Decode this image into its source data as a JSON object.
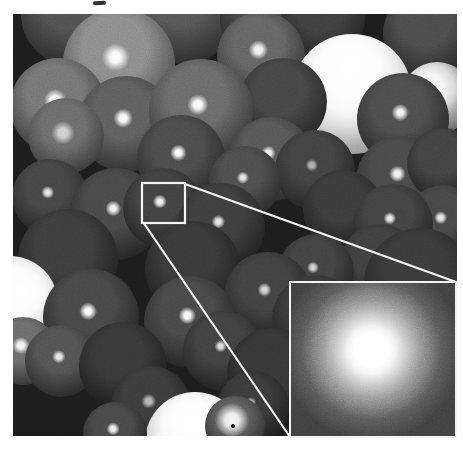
{
  "meta": {
    "alt": "Grayscale 3D rendering of densely packed overlapping spheres with specular highlights; one highlight is outlined by a small white box connected by two white leader lines to a magnified inset panel at bottom right showing a bright speckled spot"
  },
  "page": {
    "background": "#ffffff"
  },
  "photo": {
    "left": 13,
    "top": 14,
    "width": 444,
    "height": 422,
    "background": "#1c1c1c"
  },
  "artifacts": {
    "cropped_text_mark": {
      "left": 93,
      "top": 1,
      "width": 13,
      "height": 4,
      "color": "#2e2e2e"
    },
    "dark_speck": {
      "left": 231,
      "top": 424,
      "width": 4,
      "height": 4,
      "color": "#101010"
    }
  },
  "callout": {
    "stroke": "#f4f4f4",
    "stroke_width": 2.2,
    "box": {
      "x": 142,
      "y": 183,
      "width": 43,
      "height": 40
    },
    "lines": [
      {
        "x1": 185,
        "y1": 184,
        "x2": 456,
        "y2": 282
      },
      {
        "x1": 143,
        "y1": 222,
        "x2": 290,
        "y2": 437
      }
    ]
  },
  "inset": {
    "left": 289,
    "top": 281,
    "width": 168,
    "height": 157,
    "border_color": "#f2f2f2",
    "border_width": 2,
    "background": "#3e3e3e",
    "blob": {
      "x_pct": 49,
      "y_pct": 44,
      "core_color": "#ffffff",
      "halo_color": "#3e3e3e"
    }
  },
  "spheres": [
    {
      "cx": 60,
      "cy": 0,
      "r": 52,
      "shade": "#4f4f4f",
      "edge": "#1f1f1f"
    },
    {
      "cx": 170,
      "cy": -5,
      "r": 55,
      "shade": "#545454",
      "edge": "#202020"
    },
    {
      "cx": 255,
      "cy": 5,
      "r": 48,
      "shade": "#464646",
      "edge": "#1d1d1d"
    },
    {
      "cx": 310,
      "cy": 5,
      "r": 42,
      "shade": "#3e3e3e",
      "edge": "#1a1a1a"
    },
    {
      "cx": 415,
      "cy": 20,
      "r": 45,
      "shade": "#4a4a4a",
      "edge": "#1c1c1c"
    },
    {
      "cx": 106,
      "cy": 50,
      "r": 56,
      "shade": "#8a8a8a",
      "edge": "#333333",
      "hl": {
        "x": 47,
        "y": 44,
        "s": 16,
        "o": 1
      }
    },
    {
      "cx": 248,
      "cy": 42,
      "r": 44,
      "shade": "#626262",
      "edge": "#242424",
      "hl": {
        "x": 47,
        "y": 43,
        "s": 14,
        "o": 0.95
      }
    },
    {
      "cx": 339,
      "cy": 80,
      "r": 60,
      "shade": "#ececec",
      "edge": "#7d7d7d",
      "hl": {
        "x": 48,
        "y": 28,
        "s": 70,
        "o": 0.95
      }
    },
    {
      "cx": 424,
      "cy": 84,
      "r": 36,
      "shade": "#c4c4c4",
      "edge": "#4a4a4a",
      "hl": {
        "x": 40,
        "y": 35,
        "s": 50,
        "o": 0.9
      }
    },
    {
      "cx": 45,
      "cy": 92,
      "r": 48,
      "shade": "#737373",
      "edge": "#282828",
      "hl": {
        "x": 47,
        "y": 44,
        "s": 15,
        "o": 1
      }
    },
    {
      "cx": 270,
      "cy": 88,
      "r": 44,
      "shade": "#444444",
      "edge": "#1b1b1b"
    },
    {
      "cx": 113,
      "cy": 110,
      "r": 48,
      "shade": "#5d5d5d",
      "edge": "#222222",
      "hl": {
        "x": 47,
        "y": 44,
        "s": 13,
        "o": 1
      }
    },
    {
      "cx": 188,
      "cy": 97,
      "r": 52,
      "shade": "#686868",
      "edge": "#262626",
      "hl": {
        "x": 47,
        "y": 44,
        "s": 13,
        "o": 1
      }
    },
    {
      "cx": 390,
      "cy": 105,
      "r": 46,
      "shade": "#4c4c4c",
      "edge": "#1b1b1b",
      "hl": {
        "x": 47,
        "y": 43,
        "s": 12,
        "o": 0.95
      }
    },
    {
      "cx": 53,
      "cy": 122,
      "r": 38,
      "shade": "#6a6a6a",
      "edge": "#2a2a2a",
      "hl": {
        "x": 46,
        "y": 46,
        "s": 20,
        "o": 0.7
      }
    },
    {
      "cx": 168,
      "cy": 145,
      "r": 44,
      "shade": "#4a4a4a",
      "edge": "#1b1b1b",
      "hl": {
        "x": 47,
        "y": 43,
        "s": 12,
        "o": 1
      }
    },
    {
      "cx": 258,
      "cy": 145,
      "r": 42,
      "shade": "#555555",
      "edge": "#202020",
      "hl": {
        "x": 47,
        "y": 43,
        "s": 11,
        "o": 0.95
      }
    },
    {
      "cx": 302,
      "cy": 156,
      "r": 40,
      "shade": "#414141",
      "edge": "#1a1a1a",
      "hl": {
        "x": 46,
        "y": 44,
        "s": 10,
        "o": 0.6
      }
    },
    {
      "cx": 387,
      "cy": 166,
      "r": 44,
      "shade": "#484848",
      "edge": "#1b1b1b",
      "hl": {
        "x": 47,
        "y": 43,
        "s": 12,
        "o": 0.95
      }
    },
    {
      "cx": 232,
      "cy": 168,
      "r": 36,
      "shade": "#4c4c4c",
      "edge": "#1d1d1d",
      "hl": {
        "x": 47,
        "y": 44,
        "s": 11,
        "o": 0.9
      }
    },
    {
      "cx": 330,
      "cy": 196,
      "r": 40,
      "shade": "#3a3a3a",
      "edge": "#171717"
    },
    {
      "cx": 430,
      "cy": 150,
      "r": 36,
      "shade": "#424242",
      "edge": "#191919"
    },
    {
      "cx": 430,
      "cy": 209,
      "r": 38,
      "shade": "#454545",
      "edge": "#1a1a1a",
      "hl": {
        "x": 47,
        "y": 43,
        "s": 11,
        "o": 0.9
      }
    },
    {
      "cx": 380,
      "cy": 210,
      "r": 40,
      "shade": "#424242",
      "edge": "#191919",
      "hl": {
        "x": 46,
        "y": 43,
        "s": 10,
        "o": 0.9
      }
    },
    {
      "cx": 37,
      "cy": 183,
      "r": 38,
      "shade": "#444444",
      "edge": "#1a1a1a",
      "hl": {
        "x": 47,
        "y": 44,
        "s": 11,
        "o": 0.9
      }
    },
    {
      "cx": 103,
      "cy": 200,
      "r": 46,
      "shade": "#474747",
      "edge": "#191919",
      "hl": {
        "x": 47,
        "y": 44,
        "s": 11,
        "o": 0.95
      }
    },
    {
      "cx": 150,
      "cy": 194,
      "r": 40,
      "shade": "#404040",
      "edge": "#181818",
      "hl": {
        "x": 46,
        "y": 42,
        "s": 11,
        "o": 0.95
      }
    },
    {
      "cx": 208,
      "cy": 213,
      "r": 44,
      "shade": "#3d3d3d",
      "edge": "#171717",
      "hl": {
        "x": 47,
        "y": 44,
        "s": 10,
        "o": 0.9
      }
    },
    {
      "cx": 55,
      "cy": 245,
      "r": 50,
      "shade": "#3c3c3c",
      "edge": "#151515"
    },
    {
      "cx": 180,
      "cy": 255,
      "r": 48,
      "shade": "#383838",
      "edge": "#141414"
    },
    {
      "cx": 367,
      "cy": 250,
      "r": 40,
      "shade": "#3f3f3f",
      "edge": "#171717",
      "hl": {
        "x": 46,
        "y": 44,
        "s": 9,
        "o": 0.55
      }
    },
    {
      "cx": 303,
      "cy": 258,
      "r": 38,
      "shade": "#414141",
      "edge": "#181818",
      "hl": {
        "x": 46,
        "y": 44,
        "s": 10,
        "o": 0.8
      }
    },
    {
      "cx": 407,
      "cy": 270,
      "r": 56,
      "shade": "#393939",
      "edge": "#151515"
    },
    {
      "cx": 255,
      "cy": 282,
      "r": 44,
      "shade": "#404040",
      "edge": "#171717",
      "hl": {
        "x": 46,
        "y": 43,
        "s": 10,
        "o": 0.8
      }
    },
    {
      "cx": 303,
      "cy": 305,
      "r": 44,
      "shade": "#3b3b3b",
      "edge": "#161616"
    },
    {
      "cx": -3,
      "cy": 290,
      "r": 48,
      "shade": "#ececec",
      "edge": "#828282",
      "hl": {
        "x": 62,
        "y": 38,
        "s": 60,
        "o": 0.95
      }
    },
    {
      "cx": 78,
      "cy": 303,
      "r": 48,
      "shade": "#464646",
      "edge": "#181818",
      "hl": {
        "x": 47,
        "y": 44,
        "s": 12,
        "o": 1
      }
    },
    {
      "cx": 10,
      "cy": 337,
      "r": 34,
      "shade": "#6a6a6a",
      "edge": "#262626",
      "hl": {
        "x": 47,
        "y": 42,
        "s": 16,
        "o": 0.95
      }
    },
    {
      "cx": 48,
      "cy": 347,
      "r": 36,
      "shade": "#515151",
      "edge": "#1d1d1d",
      "hl": {
        "x": 47,
        "y": 44,
        "s": 12,
        "o": 0.9
      }
    },
    {
      "cx": 177,
      "cy": 308,
      "r": 46,
      "shade": "#474747",
      "edge": "#191919",
      "hl": {
        "x": 47,
        "y": 43,
        "s": 12,
        "o": 1
      }
    },
    {
      "cx": 210,
      "cy": 337,
      "r": 40,
      "shade": "#404040",
      "edge": "#171717",
      "hl": {
        "x": 47,
        "y": 44,
        "s": 10,
        "o": 0.85
      }
    },
    {
      "cx": 260,
      "cy": 360,
      "r": 46,
      "shade": "#363636",
      "edge": "#141414"
    },
    {
      "cx": 110,
      "cy": 352,
      "r": 44,
      "shade": "#373737",
      "edge": "#131313"
    },
    {
      "cx": 138,
      "cy": 392,
      "r": 40,
      "shade": "#3b3b3b",
      "edge": "#151515",
      "hl": {
        "x": 47,
        "y": 44,
        "s": 12,
        "o": 0.65
      }
    },
    {
      "cx": 240,
      "cy": 393,
      "r": 36,
      "shade": "#393939",
      "edge": "#151515",
      "hl": {
        "x": 47,
        "y": 44,
        "s": 10,
        "o": 0.7
      }
    },
    {
      "cx": 182,
      "cy": 428,
      "r": 50,
      "shade": "#ededed",
      "edge": "#8a8a8a",
      "hl": {
        "x": 48,
        "y": 30,
        "s": 60,
        "o": 0.95
      }
    },
    {
      "cx": 102,
      "cy": 420,
      "r": 32,
      "shade": "#474747",
      "edge": "#181818",
      "hl": {
        "x": 47,
        "y": 42,
        "s": 13,
        "o": 0.95
      }
    },
    {
      "cx": 222,
      "cy": 412,
      "r": 30,
      "shade": "#5a5a5a",
      "edge": "#202020",
      "hl": {
        "x": 45,
        "y": 40,
        "s": 35,
        "o": 0.95
      }
    }
  ]
}
